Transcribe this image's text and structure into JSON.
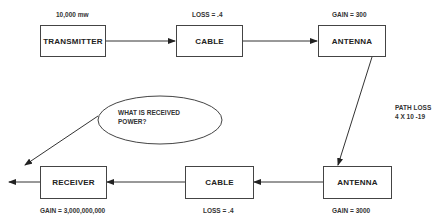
{
  "diagram": {
    "nodes": [
      {
        "id": "transmitter",
        "label": "TRANSMITTER",
        "annotation": "10,000 mw"
      },
      {
        "id": "cable_tx",
        "label": "CABLE",
        "annotation": "LOSS = .4"
      },
      {
        "id": "antenna_tx",
        "label": "ANTENNA",
        "annotation": "GAIN = 300"
      },
      {
        "id": "antenna_rx",
        "label": "ANTENNA",
        "annotation": "GAIN = 3000"
      },
      {
        "id": "cable_rx",
        "label": "CABLE",
        "annotation": "LOSS = .4"
      },
      {
        "id": "receiver",
        "label": "RECEIVER",
        "annotation": "GAIN = 3,000,000,000"
      }
    ],
    "path_loss": {
      "line1": "PATH LOSS",
      "line2": "4 X 10 -19"
    },
    "question": {
      "line1": "WHAT IS RECEIVED",
      "line2": "POWER?"
    },
    "edges": [
      {
        "from": "transmitter",
        "to": "cable_tx"
      },
      {
        "from": "cable_tx",
        "to": "antenna_tx"
      },
      {
        "from": "antenna_tx",
        "to": "antenna_rx",
        "label": "PATH LOSS 4 X 10 -19"
      },
      {
        "from": "antenna_rx",
        "to": "cable_rx"
      },
      {
        "from": "cable_rx",
        "to": "receiver"
      },
      {
        "from": "receiver",
        "to": "output"
      },
      {
        "from": "question",
        "to": "output"
      }
    ]
  }
}
